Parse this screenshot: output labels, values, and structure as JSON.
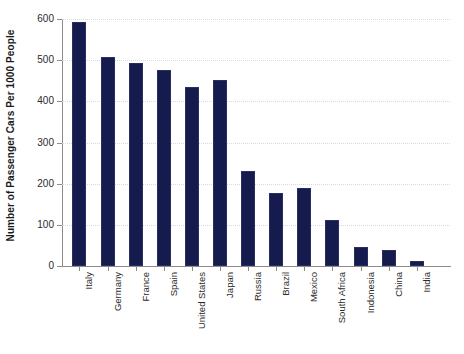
{
  "chart_data": {
    "type": "bar",
    "title": "",
    "subtitle": "",
    "xlabel": "",
    "ylabel": "Number of Passenger Cars Per 1000 People",
    "ylim": [
      0,
      600
    ],
    "yticks": [
      0,
      100,
      200,
      300,
      400,
      500,
      600
    ],
    "ytick_labels": [
      "0",
      "100",
      "200",
      "300",
      "400",
      "500",
      "600"
    ],
    "grid": true,
    "grid_axis": "y",
    "legend": false,
    "legend_position": "none",
    "bar_color": "#151b4d",
    "categories": [
      "Italy",
      "Germany",
      "France",
      "Spain",
      "United States",
      "Japan",
      "Russia",
      "Brazil",
      "Mexico",
      "South Africa",
      "Indonesia",
      "China",
      "India"
    ],
    "values": [
      593,
      507,
      493,
      476,
      435,
      451,
      232,
      177,
      190,
      112,
      46,
      38,
      13
    ],
    "series": [
      {
        "name": "Passenger cars per 1000 people",
        "values": [
          593,
          507,
          493,
          476,
          435,
          451,
          232,
          177,
          190,
          112,
          46,
          38,
          13
        ]
      }
    ]
  }
}
